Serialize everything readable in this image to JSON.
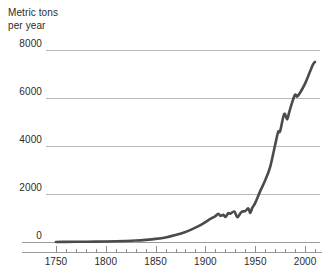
{
  "chart_data": {
    "type": "line",
    "title": "",
    "subtitle": "",
    "ylabel_line1": "Metric tons",
    "ylabel_line2": "per year",
    "xlabel": "",
    "xlim": [
      1740,
      2015
    ],
    "ylim": [
      0,
      8000
    ],
    "grid": true,
    "legend": "none",
    "y_ticks": [
      {
        "value": 8000,
        "label": "8000"
      },
      {
        "value": 6000,
        "label": "6000"
      },
      {
        "value": 4000,
        "label": "4000"
      },
      {
        "value": 2000,
        "label": "2000"
      },
      {
        "value": 0,
        "label": "0"
      }
    ],
    "x_ticks": [
      {
        "value": 1750,
        "label": "1750"
      },
      {
        "value": 1800,
        "label": "1800"
      },
      {
        "value": 1850,
        "label": "1850"
      },
      {
        "value": 1900,
        "label": "1900"
      },
      {
        "value": 1950,
        "label": "1950"
      },
      {
        "value": 2000,
        "label": "2000"
      }
    ],
    "x_minor_tick_interval": 10,
    "line_color": "#4b4b4b",
    "grid_color": "#b9b9b9",
    "axis_color": "#9a9a9a",
    "series": [
      {
        "name": "Emissions",
        "x": [
          1750,
          1760,
          1770,
          1780,
          1790,
          1800,
          1810,
          1820,
          1830,
          1840,
          1850,
          1860,
          1870,
          1880,
          1890,
          1895,
          1900,
          1905,
          1910,
          1913,
          1915,
          1918,
          1920,
          1923,
          1925,
          1929,
          1932,
          1935,
          1937,
          1940,
          1943,
          1945,
          1947,
          1950,
          1955,
          1960,
          1965,
          1970,
          1973,
          1975,
          1979,
          1982,
          1984,
          1987,
          1990,
          1992,
          1995,
          2000,
          2005,
          2008,
          2010
        ],
        "y": [
          3,
          5,
          8,
          12,
          16,
          22,
          30,
          42,
          60,
          90,
          130,
          190,
          290,
          420,
          600,
          700,
          830,
          960,
          1080,
          1180,
          1090,
          1130,
          1040,
          1200,
          1180,
          1270,
          1030,
          1190,
          1270,
          1290,
          1400,
          1210,
          1420,
          1630,
          2120,
          2570,
          3130,
          4050,
          4590,
          4620,
          5330,
          5110,
          5390,
          5810,
          6140,
          6060,
          6220,
          6600,
          7100,
          7400,
          7500
        ]
      }
    ]
  }
}
